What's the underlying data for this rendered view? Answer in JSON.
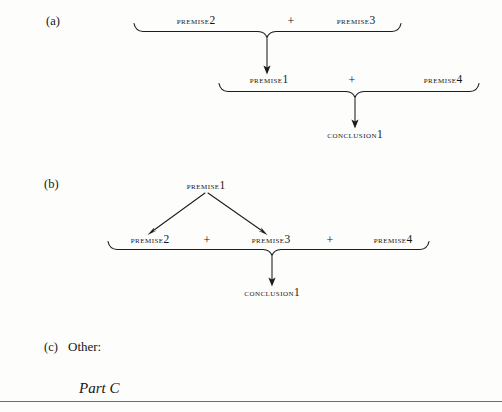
{
  "page": {
    "background_color": "#fdfdfc",
    "ink_color": "#1c1c20"
  },
  "diagrams": [
    {
      "id": "a",
      "marker": "(a)",
      "rows": [
        {
          "id": "a-row-1",
          "items": [
            {
              "kind": "node",
              "text": "PREMISE",
              "number": "2"
            },
            {
              "kind": "operator",
              "text": "+"
            },
            {
              "kind": "node",
              "text": "PREMISE",
              "number": "3"
            }
          ]
        },
        {
          "id": "a-row-2",
          "items": [
            {
              "kind": "node",
              "text": "PREMISE",
              "number": "1"
            },
            {
              "kind": "operator",
              "text": "+"
            },
            {
              "kind": "node",
              "text": "PREMISE",
              "number": "4"
            }
          ]
        },
        {
          "id": "a-row-3",
          "items": [
            {
              "kind": "node",
              "text": "CONCLUSION",
              "number": "1"
            }
          ]
        }
      ]
    },
    {
      "id": "b",
      "marker": "(b)",
      "rows": [
        {
          "id": "b-row-1",
          "items": [
            {
              "kind": "node",
              "text": "PREMISE",
              "number": "1"
            }
          ]
        },
        {
          "id": "b-row-2",
          "items": [
            {
              "kind": "node",
              "text": "PREMISE",
              "number": "2"
            },
            {
              "kind": "operator",
              "text": "+"
            },
            {
              "kind": "node",
              "text": "PREMISE",
              "number": "3"
            },
            {
              "kind": "operator",
              "text": "+"
            },
            {
              "kind": "node",
              "text": "PREMISE",
              "number": "4"
            }
          ]
        },
        {
          "id": "b-row-3",
          "items": [
            {
              "kind": "node",
              "text": "CONCLUSION",
              "number": "1"
            }
          ]
        }
      ]
    },
    {
      "id": "c",
      "marker": "(c)",
      "label": "Other:"
    }
  ],
  "labels": {
    "a_marker": "(a)",
    "b_marker": "(b)",
    "c_marker": "(c)",
    "c_text": "Other:",
    "part": "Part C"
  },
  "nodes": {
    "a1_premise2": {
      "word": "PREMISE",
      "num": "2"
    },
    "a1_plus": "+",
    "a1_premise3": {
      "word": "PREMISE",
      "num": "3"
    },
    "a2_premise1": {
      "word": "PREMISE",
      "num": "1"
    },
    "a2_plus": "+",
    "a2_premise4": {
      "word": "PREMISE",
      "num": "4"
    },
    "a3_conclusion1": {
      "word": "CONCLUSION",
      "num": "1"
    },
    "b1_premise1": {
      "word": "PREMISE",
      "num": "1"
    },
    "b2_premise2": {
      "word": "PREMISE",
      "num": "2"
    },
    "b2_plus1": "+",
    "b2_premise3": {
      "word": "PREMISE",
      "num": "3"
    },
    "b2_plus2": "+",
    "b2_premise4": {
      "word": "PREMISE",
      "num": "4"
    },
    "b3_conclusion1": {
      "word": "CONCLUSION",
      "num": "1"
    }
  }
}
